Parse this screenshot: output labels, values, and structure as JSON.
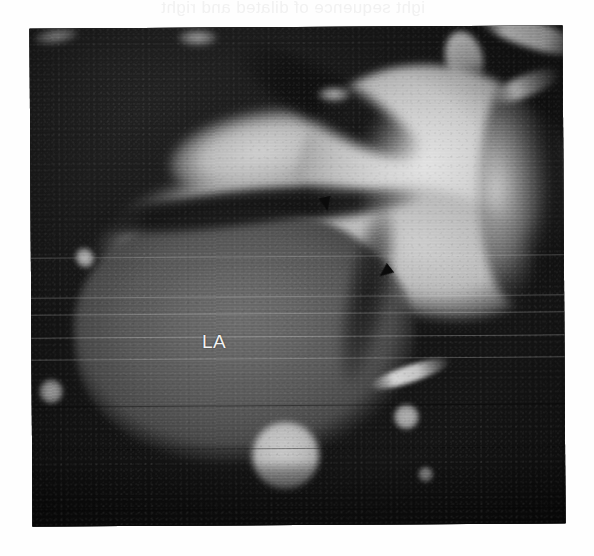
{
  "page": {
    "background_color": "#fefefe",
    "bleed_through_text": "ight sequence of dilated and right"
  },
  "figure": {
    "modality": "cardiac magnetic resonance / CT tomographic section",
    "plane": "oblique axial (four-chamber oriented) section",
    "frame": {
      "x": 31,
      "y": 27,
      "width": 533,
      "height": 498,
      "border_color": "#131313"
    },
    "annotations": {
      "labels": [
        {
          "id": "la",
          "text": "LA",
          "meaning": "left atrium",
          "x": 202,
          "y": 331,
          "color": "#f2f2f2"
        }
      ],
      "arrowheads": [
        {
          "id": "arrow-1",
          "x": 320,
          "y": 197,
          "rotation_deg": -12,
          "color": "#0b0b0b",
          "points_to": "superior left atrial wall / interatrial junction"
        },
        {
          "id": "arrow-2",
          "x": 379,
          "y": 265,
          "rotation_deg": 52,
          "color": "#0b0b0b",
          "points_to": "atrioventricular groove margin"
        }
      ]
    },
    "structures": [
      {
        "name": "left-ventricle-cavity",
        "tone": "bright",
        "hex": "#d4d4d4",
        "location": "upper right"
      },
      {
        "name": "pulmonary-vein-band",
        "tone": "bright",
        "hex": "#cfcfcf",
        "location": "upper left, oblique band"
      },
      {
        "name": "left-atrium",
        "tone": "mid-gray",
        "hex": "#626262",
        "location": "lower left, large oval"
      },
      {
        "name": "descending-aorta",
        "tone": "bright round",
        "hex": "#bdbdbd",
        "location": "lower centre"
      },
      {
        "name": "pulmonary-artery-branches",
        "tone": "bright",
        "hex": "#e2e2e2",
        "location": "top right"
      },
      {
        "name": "background-mediastinum",
        "tone": "dark",
        "hex": "#1a1a1a",
        "location": "periphery"
      }
    ],
    "artifacts": [
      {
        "name": "horizontal-scanline-raster",
        "description": "print raster / scan lines across whole plate"
      },
      {
        "name": "film-grain",
        "description": "fine halftone grain from scanned print"
      }
    ]
  }
}
